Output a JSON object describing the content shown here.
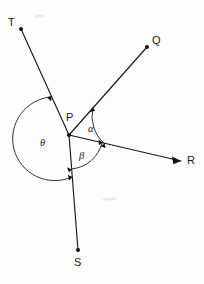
{
  "figure": {
    "type": "geometry-diagram",
    "width": 204,
    "height": 284,
    "background_color": "#fdfdfd",
    "line_color": "#1a1a1a",
    "arc_color": "#2a2a2a",
    "vertex": {
      "label": "P",
      "x": 69,
      "y": 135,
      "label_x": 66,
      "label_y": 112
    },
    "rays": [
      {
        "name": "ray-PT",
        "label": "T",
        "end_x": 21,
        "end_y": 29,
        "label_x": 8,
        "label_y": 17,
        "terminator": "dot",
        "angle_deg": 114.4
      },
      {
        "name": "ray-PQ",
        "label": "Q",
        "end_x": 147,
        "end_y": 47,
        "label_x": 152,
        "label_y": 35,
        "terminator": "dot",
        "angle_deg": 48.4
      },
      {
        "name": "ray-PR",
        "label": "R",
        "end_x": 181,
        "end_y": 161,
        "label_x": 187,
        "label_y": 155,
        "terminator": "arrow",
        "angle_deg": -13.1
      },
      {
        "name": "ray-PS",
        "label": "S",
        "end_x": 78,
        "end_y": 250,
        "label_x": 74,
        "label_y": 257,
        "terminator": "dot",
        "angle_deg": -85.5
      }
    ],
    "angles": [
      {
        "name": "angle-alpha",
        "label": "α",
        "between": "Q and R",
        "radius": 36,
        "start_deg": -13.1,
        "end_deg": 48.4,
        "label_x": 88,
        "label_y": 124,
        "arrowheads": "both"
      },
      {
        "name": "angle-beta",
        "label": "β",
        "between": "R and S",
        "radius": 34,
        "start_deg": -85.5,
        "end_deg": -13.1,
        "label_x": 79,
        "label_y": 151,
        "arrowheads": "both"
      },
      {
        "name": "angle-theta",
        "label": "θ",
        "between": "T and S (reflex side, counterclockwise through left)",
        "radius": 42,
        "start_deg": 114.4,
        "end_deg": 274.5,
        "label_x": 40,
        "label_y": 138,
        "arrowheads": "both"
      }
    ],
    "smudges": [
      {
        "name": "smudge-top",
        "x": 39,
        "y": 16,
        "width": 10,
        "height": 2.5,
        "angle": -6
      },
      {
        "name": "smudge-mid",
        "x": 108,
        "y": 199,
        "width": 14,
        "height": 2.5,
        "angle": -4
      }
    ]
  }
}
